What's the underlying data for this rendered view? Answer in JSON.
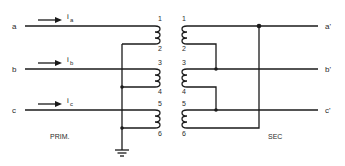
{
  "diagram": {
    "type": "three-phase transformer connection schematic",
    "primary": {
      "label": "PRIM.",
      "inputs": [
        {
          "terminal": "a",
          "current": "i",
          "current_sub": "a"
        },
        {
          "terminal": "b",
          "current": "i",
          "current_sub": "b"
        },
        {
          "terminal": "c",
          "current": "i",
          "current_sub": "c"
        }
      ],
      "winding_terminals": [
        "1",
        "2",
        "3",
        "4",
        "5",
        "6"
      ],
      "ground": "ground-symbol"
    },
    "secondary": {
      "label": "SEC",
      "outputs": [
        "a'",
        "b'",
        "c'"
      ],
      "winding_terminals": [
        "1",
        "2",
        "3",
        "4",
        "5",
        "6"
      ]
    }
  }
}
